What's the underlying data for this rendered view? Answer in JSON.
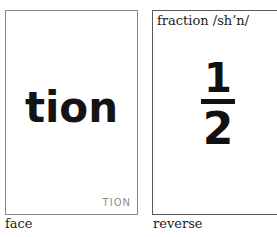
{
  "face": {
    "word": "tion",
    "corner_label": "TION",
    "caption": "face"
  },
  "reverse": {
    "heading": "fraction /sh’n/",
    "fraction": {
      "numerator": "1",
      "denominator": "2"
    },
    "caption": "reverse"
  }
}
